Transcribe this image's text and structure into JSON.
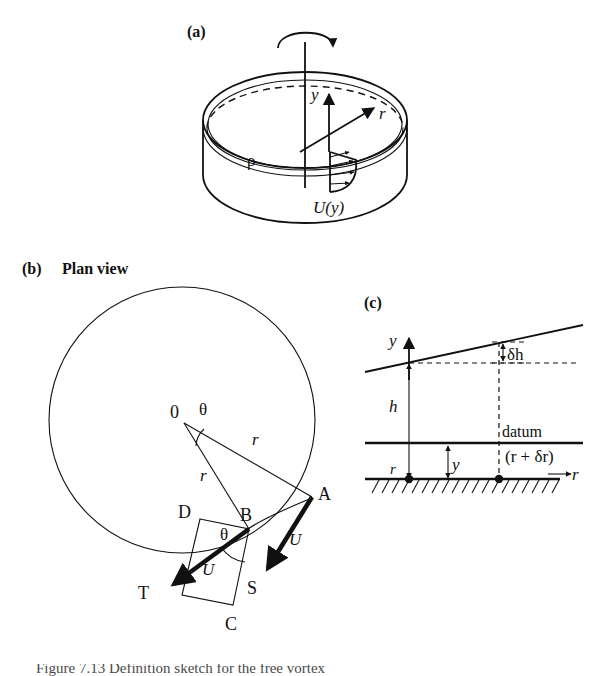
{
  "figure": {
    "domain": "Diagram",
    "background_color": "#ffffff",
    "ink_color": "#111111",
    "caption": "Figure 7.13  Definition sketch for the free vortex"
  },
  "panels": [
    {
      "id": "a",
      "label": "(a)",
      "description": "rotating-cylinder-perspective",
      "labels": {
        "vertical_axis": "y",
        "radial_axis": "r",
        "velocity_profile": "U(y)",
        "density": "ρ"
      },
      "icons": {
        "rotation": "rotation-arrow-icon",
        "y_axis": "y-axis-arrow-icon",
        "r_axis": "r-axis-arrow-icon",
        "profile": "velocity-profile-icon"
      }
    },
    {
      "id": "b",
      "label": "(b)",
      "title": "Plan view",
      "description": "plan-view-circle-vector-diagram",
      "labels": {
        "origin": "0",
        "angle_at_origin": "θ",
        "angle_at_b": "θ",
        "radius_upper": "r",
        "radius_lower": "r",
        "point_a": "A",
        "point_b": "B",
        "point_c": "C",
        "point_d": "D",
        "point_s": "S",
        "point_t": "T",
        "velocity_a": "U",
        "velocity_b": "U"
      },
      "icons": {
        "circle": "tank-boundary-circle-icon",
        "vector_as": "velocity-vector-a-to-s-icon",
        "vector_bt": "velocity-vector-b-to-t-icon",
        "parallelogram": "vector-parallelogram-icon",
        "angle_arc_origin": "angle-arc-origin-icon",
        "angle_arc_b": "angle-arc-b-icon"
      }
    },
    {
      "id": "c",
      "label": "(c)",
      "description": "radial-cross-section-free-surface",
      "labels": {
        "vertical_axis": "y",
        "radial_axis": "r",
        "depth_h": "h",
        "height_y": "y",
        "datum": "datum",
        "radius_inner": "r",
        "radius_outer": "(r + δr)",
        "delta_h": "δh"
      },
      "icons": {
        "y_axis": "y-axis-arrow-icon",
        "r_axis": "r-axis-arrow-icon",
        "free_surface": "free-surface-line-icon",
        "datum_line": "datum-line-icon",
        "bed_hatching": "bed-hatching-icon",
        "delta_h_dimension": "delta-h-dimension-icon",
        "h_dimension": "h-dimension-icon",
        "y_dimension": "y-dimension-icon"
      }
    }
  ]
}
